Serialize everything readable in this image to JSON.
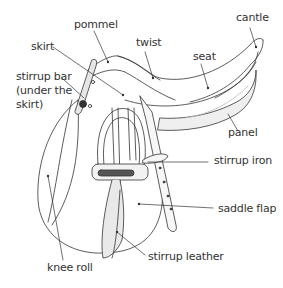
{
  "diagram": {
    "labels": {
      "pommel": "pommel",
      "cantle": "cantle",
      "twist": "twist",
      "seat": "seat",
      "skirt": "skirt",
      "stirrup_bar_1": "stirrup bar",
      "stirrup_bar_2": "(under the",
      "stirrup_bar_3": "skirt)",
      "panel": "panel",
      "stirrup_iron": "stirrup iron",
      "saddle_flap": "saddle flap",
      "stirrup_leather": "stirrup leather",
      "knee_roll": "knee roll"
    },
    "colors": {
      "ink": "#333333",
      "background": "#ffffff",
      "shade": "#bdbdbd"
    }
  }
}
